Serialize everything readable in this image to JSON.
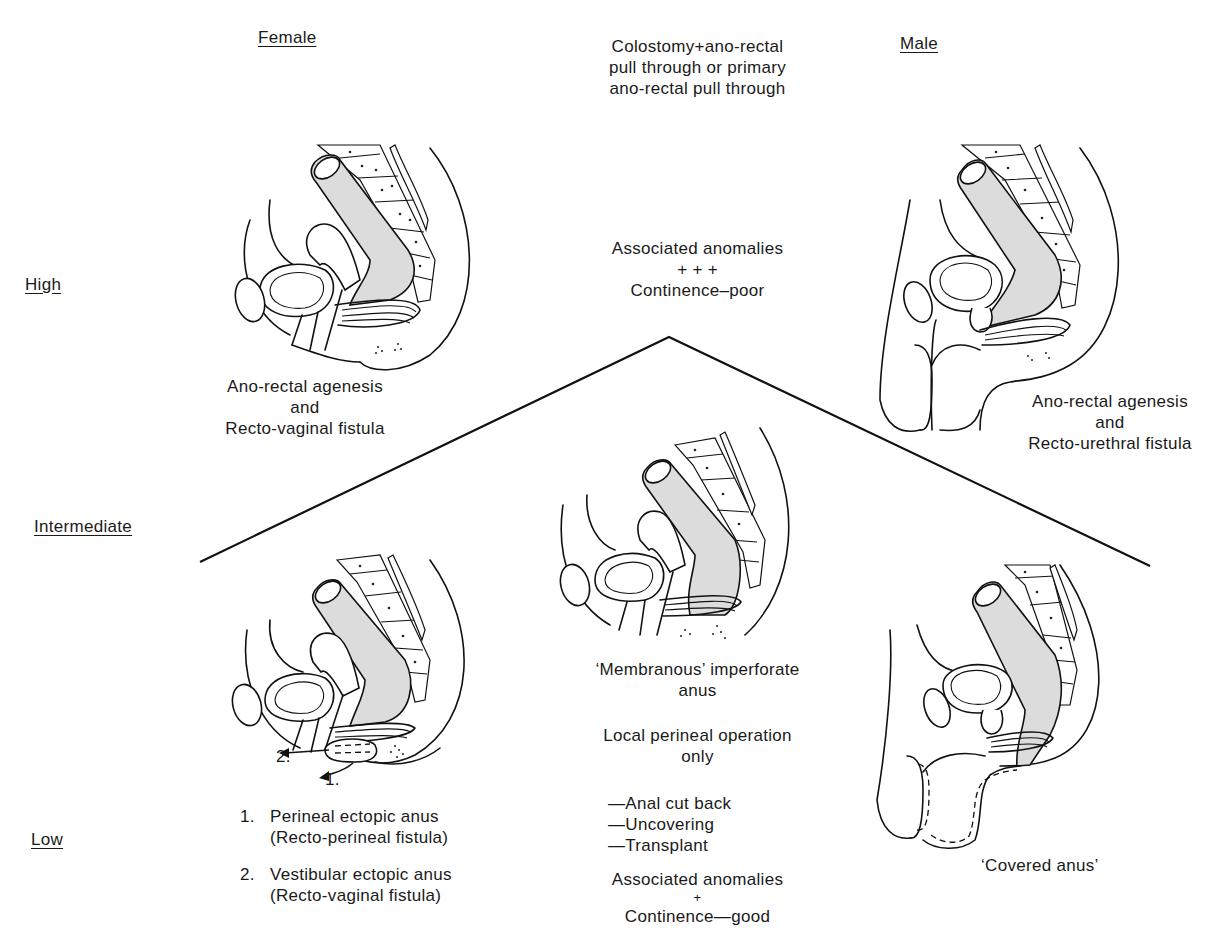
{
  "headers": {
    "female": "Female",
    "male": "Male",
    "treatment_high": [
      "Colostomy+ano-rectal",
      "pull through or primary",
      "ano-rectal pull through"
    ]
  },
  "levels": {
    "high": "High",
    "intermediate": "Intermediate",
    "low": "Low"
  },
  "high": {
    "prognosis": [
      "Associated anomalies",
      "+ + +",
      "Continence–poor"
    ],
    "female_caption": [
      "Ano-rectal agenesis",
      "and",
      "Recto-vaginal fistula"
    ],
    "male_caption": [
      "Ano-rectal agenesis",
      "and",
      "Recto-urethral fistula"
    ]
  },
  "intermediate": {
    "caption": [
      "‘Membranous’ imperforate",
      "anus"
    ]
  },
  "low": {
    "arrow_labels": [
      "2.",
      "1."
    ],
    "female_list": [
      {
        "num": "1.",
        "title": "Perineal ectopic anus",
        "sub": "(Recto-perineal fistula)"
      },
      {
        "num": "2.",
        "title": "Vestibular ectopic anus",
        "sub": "(Recto-vaginal fistula)"
      }
    ],
    "treatment": [
      "Local perineal operation",
      "only"
    ],
    "options": [
      "—Anal cut back",
      "—Uncovering",
      "—Transplant"
    ],
    "prognosis": [
      "Associated anomalies",
      "+",
      "Continence—good"
    ],
    "male_caption": "‘Covered anus’"
  },
  "colors": {
    "ink": "#111111",
    "rectum_fill": "#dcdcdc",
    "background": "#ffffff"
  }
}
